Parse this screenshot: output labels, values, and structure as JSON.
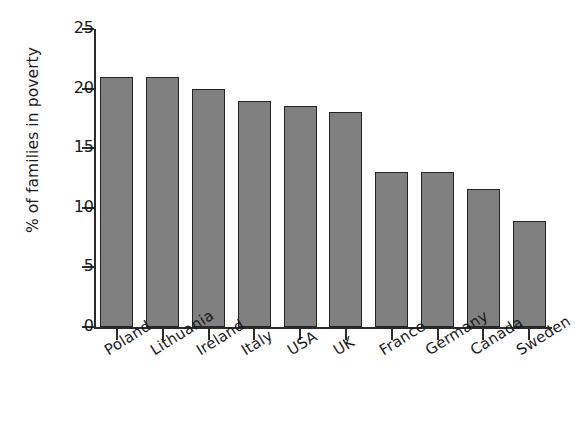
{
  "chart_data": {
    "type": "bar",
    "title": "",
    "xlabel": "",
    "ylabel": "% of families in poverty",
    "ylim": [
      0,
      25
    ],
    "yticks": [
      0,
      5,
      10,
      15,
      20,
      25
    ],
    "ytick_labels": [
      "0",
      "5",
      "10",
      "15",
      "20",
      "25"
    ],
    "grid": false,
    "legend": null,
    "bar_color": "#808080",
    "bar_edge_color": "#242424",
    "axis_color": "#2b2b2b",
    "categories": [
      "Poland",
      "Lithuania",
      "Ireland",
      "Italy",
      "USA",
      "UK",
      "France",
      "Germany",
      "Canada",
      "Sweden"
    ],
    "values": [
      21,
      21,
      20,
      19,
      18.5,
      18,
      13,
      13,
      11.6,
      8.9
    ]
  }
}
